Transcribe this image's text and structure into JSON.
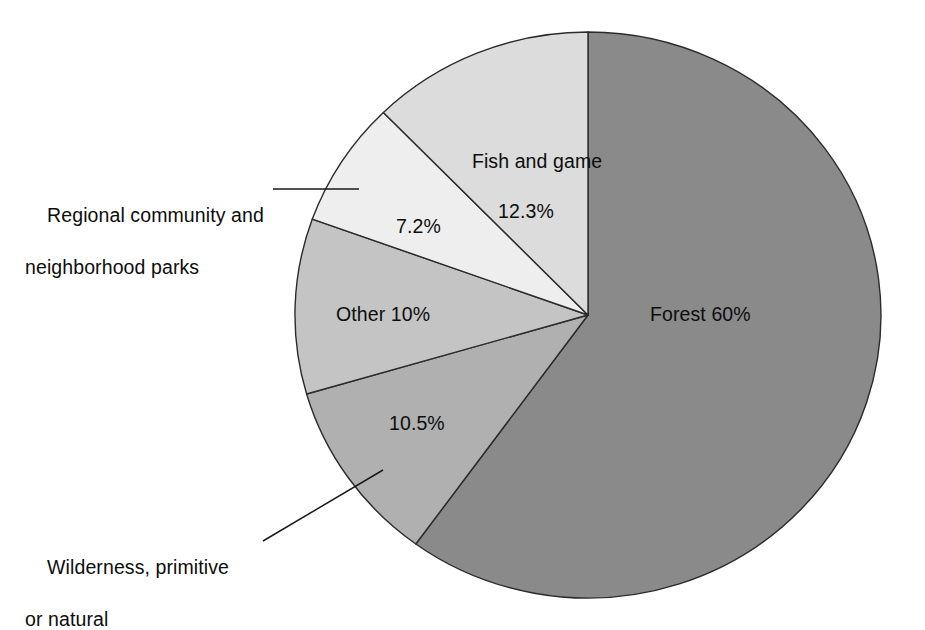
{
  "chart_data": {
    "type": "pie",
    "title": "",
    "subtitle": "",
    "xlabel": "",
    "ylabel": "",
    "legend_position": "none",
    "grid": false,
    "units": "percent",
    "start_angle_deg": 0,
    "direction": "clockwise",
    "categories": [
      "Forest",
      "Wilderness, primitive or natural",
      "Other",
      "Regional community and neighborhood parks",
      "Fish and game"
    ],
    "values": [
      60,
      10.5,
      10,
      7.2,
      12.3
    ],
    "colors": [
      "#8a8a8a",
      "#b0b0b0",
      "#c4c4c4",
      "#eeeeee",
      "#dcdcdc"
    ],
    "slices": [
      {
        "name": "Forest",
        "value": 60,
        "value_text": "60%",
        "label_text": "Forest 60%",
        "color": "#8a8a8a",
        "label_placement": "inside",
        "start_pct": 0,
        "end_pct": 60
      },
      {
        "name": "Wilderness, primitive or natural",
        "value": 10.5,
        "value_text": "10.5%",
        "label_text": "10.5%",
        "callout_line1": "Wilderness, primitive",
        "callout_line2": "or natural",
        "color": "#b0b0b0",
        "label_placement": "inside-value-with-callout",
        "start_pct": 60,
        "end_pct": 70.5
      },
      {
        "name": "Other",
        "value": 10,
        "value_text": "10%",
        "label_text": "Other 10%",
        "color": "#c4c4c4",
        "label_placement": "inside",
        "start_pct": 70.5,
        "end_pct": 80.5
      },
      {
        "name": "Regional community and neighborhood parks",
        "value": 7.2,
        "value_text": "7.2%",
        "label_text": "7.2%",
        "callout_line1": "Regional community and",
        "callout_line2": "neighborhood parks",
        "color": "#eeeeee",
        "label_placement": "inside-value-with-callout",
        "start_pct": 80.5,
        "end_pct": 87.7
      },
      {
        "name": "Fish and game",
        "value": 12.3,
        "value_text": "12.3%",
        "label_text": "Fish and game",
        "label_line2": "12.3%",
        "color": "#dcdcdc",
        "label_placement": "inside",
        "start_pct": 87.7,
        "end_pct": 100
      }
    ]
  },
  "labels": {
    "forest": "Forest 60%",
    "fish_and_game_name": "Fish and game",
    "fish_and_game_value": "12.3%",
    "regional_value": "7.2%",
    "regional_line1": "Regional community and",
    "regional_line2": "neighborhood parks",
    "other": "Other 10%",
    "wilderness_value": "10.5%",
    "wilderness_line1": "Wilderness, primitive",
    "wilderness_line2": "or natural"
  },
  "style": {
    "background": "#ffffff",
    "text_color": "#0d0d0d",
    "outline_color": "#2b2b2b",
    "leader_color": "#1a1a1a"
  }
}
